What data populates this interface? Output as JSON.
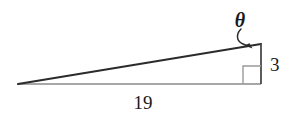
{
  "figure": {
    "type": "right-triangle-diagram",
    "background_color": "#ffffff",
    "stroke_color": "#2b2b2b",
    "light_stroke_color": "#8a8a8a",
    "labels": {
      "angle": "θ",
      "opposite_side": "3",
      "adjacent_side": "19"
    },
    "geometry": {
      "left_vertex": [
        18,
        84
      ],
      "right_bottom_vertex": [
        261,
        84
      ],
      "right_top_vertex": [
        261,
        44
      ],
      "base_length_label": "19",
      "height_length_label": "3",
      "right_angle_marker": true
    },
    "label_positions": {
      "theta": [
        240,
        26
      ],
      "three": [
        270,
        70
      ],
      "nineteen": [
        143,
        107
      ]
    }
  }
}
